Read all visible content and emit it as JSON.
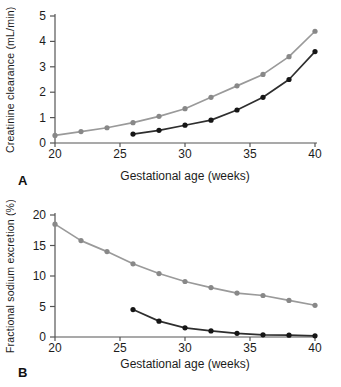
{
  "style": {
    "background": "#ffffff",
    "axis_color": "#555555",
    "text_color": "#1c1c1c",
    "gray_series_color": "#9a9a9a",
    "gray_marker_color": "#888888",
    "black_series_color": "#2e2e2e",
    "black_marker_color": "#161616"
  },
  "chart_data": [
    {
      "type": "line",
      "panel_label": "A",
      "xlabel": "Gestational age (weeks)",
      "ylabel": "Creatinine clearance (mL/min)",
      "xlim": [
        20,
        40
      ],
      "ylim": [
        0,
        5
      ],
      "xticks": [
        20,
        25,
        30,
        35,
        40
      ],
      "yticks": [
        0,
        1,
        2,
        3,
        4,
        5
      ],
      "grid": false,
      "legend": "none",
      "series": [
        {
          "name": "gray-series",
          "color": "#9a9a9a",
          "marker_color": "#888888",
          "x": [
            20,
            22,
            24,
            26,
            28,
            30,
            32,
            34,
            36,
            38,
            40
          ],
          "values": [
            0.3,
            0.45,
            0.6,
            0.8,
            1.05,
            1.35,
            1.8,
            2.25,
            2.7,
            3.4,
            4.4
          ]
        },
        {
          "name": "black-series",
          "color": "#2e2e2e",
          "marker_color": "#161616",
          "x": [
            26,
            28,
            30,
            32,
            34,
            36,
            38,
            40
          ],
          "values": [
            0.35,
            0.5,
            0.7,
            0.9,
            1.3,
            1.8,
            2.5,
            3.6
          ]
        }
      ]
    },
    {
      "type": "line",
      "panel_label": "B",
      "xlabel": "Gestational age (weeks)",
      "ylabel": "Fractional sodium excretion (%)",
      "xlim": [
        20,
        40
      ],
      "ylim": [
        0,
        20
      ],
      "xticks": [
        20,
        25,
        30,
        35,
        40
      ],
      "yticks": [
        0,
        5,
        10,
        15,
        20
      ],
      "grid": false,
      "legend": "none",
      "series": [
        {
          "name": "gray-series",
          "color": "#9a9a9a",
          "marker_color": "#888888",
          "x": [
            20,
            22,
            24,
            26,
            28,
            30,
            32,
            34,
            36,
            38,
            40
          ],
          "values": [
            18.5,
            15.8,
            14.0,
            12.0,
            10.4,
            9.1,
            8.1,
            7.2,
            6.8,
            6.0,
            5.2
          ]
        },
        {
          "name": "black-series",
          "color": "#2e2e2e",
          "marker_color": "#161616",
          "x": [
            26,
            28,
            30,
            32,
            34,
            36,
            38,
            40
          ],
          "values": [
            4.5,
            2.6,
            1.5,
            1.0,
            0.6,
            0.35,
            0.3,
            0.2
          ]
        }
      ]
    }
  ]
}
